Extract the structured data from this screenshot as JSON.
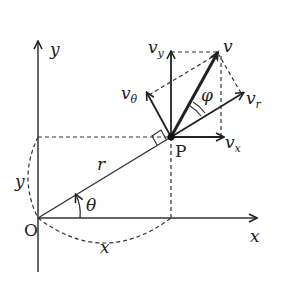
{
  "diagram": {
    "axes": {
      "x_label": "x",
      "y_label": "y",
      "origin_label": "O"
    },
    "point": {
      "label": "P"
    },
    "segments": {
      "radius_label": "r",
      "angle_label": "θ",
      "x_projection_label": "x",
      "y_projection_label": "y"
    },
    "vectors": {
      "v": {
        "label": "v"
      },
      "v_x": {
        "base": "v",
        "sub": "x"
      },
      "v_y": {
        "base": "v",
        "sub": "y"
      },
      "v_r": {
        "base": "v",
        "sub": "r"
      },
      "v_theta": {
        "base": "v",
        "sub": "θ"
      }
    },
    "angles": {
      "phi_label": "φ"
    },
    "colors": {
      "ink": "#222222",
      "background": "#ffffff"
    }
  }
}
